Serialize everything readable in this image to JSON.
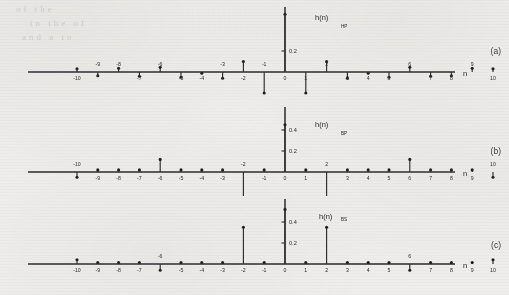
{
  "figure": {
    "xlabel": "n",
    "panels": [
      {
        "id": "a",
        "panel_label": "(a)",
        "series_label": "h(n)",
        "series_subscript": "HP",
        "ytick_labels": [
          "0.2"
        ],
        "ytick_values": [
          0.2
        ],
        "xmin": -10,
        "xmax": 10,
        "xtick_labels": [
          "-10",
          "-9",
          "-8",
          "-7",
          "-6",
          "-5",
          "-4",
          "-3",
          "-2",
          "-1",
          "0",
          "1",
          "2",
          "3",
          "4",
          "5",
          "6",
          "7",
          "8",
          "9",
          "10"
        ],
        "xlabel_sides": [
          "below",
          "above",
          "above",
          "below",
          "above",
          "below",
          "below",
          "above",
          "below",
          "above",
          "below",
          "below",
          "above",
          "below",
          "below",
          "below",
          "above",
          "below",
          "below",
          "above",
          "below"
        ],
        "values": [
          0.03,
          -0.035,
          0.035,
          -0.04,
          0.045,
          -0.05,
          -0.012,
          -0.06,
          0.1,
          -0.2,
          0.55,
          -0.2,
          0.1,
          -0.06,
          -0.012,
          -0.05,
          0.045,
          -0.04,
          -0.035,
          0.035,
          0.03
        ]
      },
      {
        "id": "b",
        "panel_label": "(b)",
        "series_label": "h(n)",
        "series_subscript": "BP",
        "ytick_labels": [
          "0.4",
          "0.2"
        ],
        "ytick_values": [
          0.4,
          0.2
        ],
        "xmin": -10,
        "xmax": 10,
        "xtick_labels": [
          "-10",
          "-9",
          "-8",
          "-7",
          "-6",
          "-5",
          "-4",
          "-3",
          "-2",
          "-1",
          "0",
          "1",
          "2",
          "3",
          "4",
          "5",
          "6",
          "7",
          "8",
          "9",
          "10"
        ],
        "xlabel_sides": [
          "above",
          "below",
          "below",
          "below",
          "below",
          "below",
          "below",
          "below",
          "above",
          "below",
          "below",
          "below",
          "above",
          "below",
          "below",
          "below",
          "below",
          "below",
          "below",
          "below",
          "above"
        ],
        "values": [
          -0.05,
          0.02,
          0.02,
          0.02,
          0.12,
          0.02,
          0.02,
          0.02,
          -0.3,
          0.02,
          0.45,
          0.02,
          -0.3,
          0.02,
          0.02,
          0.02,
          0.12,
          0.02,
          0.02,
          0.02,
          -0.05
        ]
      },
      {
        "id": "c",
        "panel_label": "(c)",
        "series_label": "h(n)",
        "series_subscript": "BS",
        "ytick_labels": [
          "0.4",
          "0.2"
        ],
        "ytick_values": [
          0.4,
          0.2
        ],
        "xmin": -10,
        "xmax": 10,
        "xtick_labels": [
          "-10",
          "-9",
          "-8",
          "-7",
          "-6",
          "-5",
          "-4",
          "-3",
          "-2",
          "-1",
          "0",
          "1",
          "2",
          "3",
          "4",
          "5",
          "6",
          "7",
          "8",
          "9",
          "10"
        ],
        "xlabel_sides": [
          "below",
          "below",
          "below",
          "below",
          "above",
          "below",
          "below",
          "below",
          "below",
          "below",
          "below",
          "below",
          "below",
          "below",
          "below",
          "below",
          "above",
          "below",
          "below",
          "below",
          "below"
        ],
        "values": [
          0.04,
          0.015,
          0.015,
          0.015,
          -0.06,
          0.015,
          0.015,
          0.015,
          0.35,
          0.015,
          0.52,
          0.015,
          0.35,
          0.015,
          0.015,
          0.015,
          -0.06,
          0.015,
          0.015,
          0.015,
          0.04
        ]
      }
    ]
  },
  "scan_artifacts": {
    "ghost_lines": [
      "of            the",
      "in   the         of",
      "and  a       to"
    ]
  },
  "chart_data": {
    "type": "line",
    "xlabel": "n",
    "ylabel": "h(n)",
    "xlim": [
      -10,
      10
    ],
    "series": [
      {
        "name": "h(n)_HP",
        "panel": "(a)",
        "x": [
          -10,
          -9,
          -8,
          -7,
          -6,
          -5,
          -4,
          -3,
          -2,
          -1,
          0,
          1,
          2,
          3,
          4,
          5,
          6,
          7,
          8,
          9,
          10
        ],
        "values": [
          0.03,
          -0.035,
          0.035,
          -0.04,
          0.045,
          -0.05,
          -0.012,
          -0.06,
          0.1,
          -0.2,
          0.55,
          -0.2,
          0.1,
          -0.06,
          -0.012,
          -0.05,
          0.045,
          -0.04,
          -0.035,
          0.035,
          0.03
        ]
      },
      {
        "name": "h(n)_BP",
        "panel": "(b)",
        "x": [
          -10,
          -9,
          -8,
          -7,
          -6,
          -5,
          -4,
          -3,
          -2,
          -1,
          0,
          1,
          2,
          3,
          4,
          5,
          6,
          7,
          8,
          9,
          10
        ],
        "values": [
          -0.05,
          0.02,
          0.02,
          0.02,
          0.12,
          0.02,
          0.02,
          0.02,
          -0.3,
          0.02,
          0.45,
          0.02,
          -0.3,
          0.02,
          0.02,
          0.02,
          0.12,
          0.02,
          0.02,
          0.02,
          -0.05
        ]
      },
      {
        "name": "h(n)_BS",
        "panel": "(c)",
        "x": [
          -10,
          -9,
          -8,
          -7,
          -6,
          -5,
          -4,
          -3,
          -2,
          -1,
          0,
          1,
          2,
          3,
          4,
          5,
          6,
          7,
          8,
          9,
          10
        ],
        "values": [
          0.04,
          0.015,
          0.015,
          0.015,
          -0.06,
          0.015,
          0.015,
          0.015,
          0.35,
          0.015,
          0.52,
          0.015,
          0.35,
          0.015,
          0.015,
          0.015,
          -0.06,
          0.015,
          0.015,
          0.015,
          0.04
        ]
      }
    ],
    "grid": false,
    "legend": "none"
  }
}
